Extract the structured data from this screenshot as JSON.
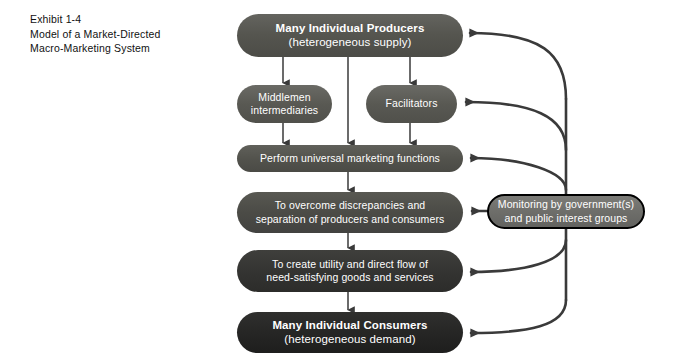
{
  "exhibit": {
    "number": "Exhibit 1-4",
    "title_line1": "Model of a Market-Directed",
    "title_line2": "Macro-Marketing System"
  },
  "diagram": {
    "type": "flow",
    "orientation": "top-to-bottom",
    "nodes": [
      {
        "id": "producers",
        "line1": "Many Individual Producers",
        "line2": "(heterogeneous supply)",
        "fill": "#55554f",
        "shape": "rounded-pill"
      },
      {
        "id": "middlemen",
        "line1": "Middlemen",
        "line2": "intermediaries",
        "fill": "#595953",
        "shape": "rounded-pill"
      },
      {
        "id": "facilitators",
        "line1": "Facilitators",
        "line2": "",
        "fill": "#595953",
        "shape": "rounded-pill"
      },
      {
        "id": "perform",
        "line1": "Perform universal marketing functions",
        "line2": "",
        "fill": "#53534d",
        "shape": "rounded-pill"
      },
      {
        "id": "overcome",
        "line1": "To overcome discrepancies and",
        "line2": "separation of producers and consumers",
        "fill": "#4b4b46",
        "shape": "rounded-pill"
      },
      {
        "id": "utility",
        "line1": "To create utility and direct flow of",
        "line2": "need-satisfying goods and services",
        "fill": "#343432",
        "shape": "rounded-pill"
      },
      {
        "id": "consumers",
        "line1": "Many Individual Consumers",
        "line2": "(heterogeneous demand)",
        "fill": "#262625",
        "shape": "rounded-pill"
      },
      {
        "id": "monitor",
        "line1": "Monitoring by government(s)",
        "line2": "and public interest groups",
        "fill": "#6e6e6a",
        "border": "#000000",
        "shape": "rounded-pill-outlined"
      }
    ],
    "edges": [
      {
        "from": "producers",
        "to": "middlemen",
        "style": "straight-arrow-down"
      },
      {
        "from": "producers",
        "to": "facilitators",
        "style": "straight-arrow-down"
      },
      {
        "from": "producers",
        "to": "perform",
        "style": "straight-arrow-down"
      },
      {
        "from": "middlemen",
        "to": "perform",
        "style": "straight-arrow-down"
      },
      {
        "from": "facilitators",
        "to": "perform",
        "style": "straight-arrow-down"
      },
      {
        "from": "perform",
        "to": "overcome",
        "style": "straight-arrow-down"
      },
      {
        "from": "overcome",
        "to": "utility",
        "style": "straight-arrow-down"
      },
      {
        "from": "utility",
        "to": "consumers",
        "style": "straight-arrow-down"
      },
      {
        "from": "monitor",
        "to": "producers",
        "style": "curved-arrow-left"
      },
      {
        "from": "monitor",
        "to": "facilitators",
        "style": "curved-arrow-left"
      },
      {
        "from": "monitor",
        "to": "perform",
        "style": "curved-arrow-left"
      },
      {
        "from": "monitor",
        "to": "overcome",
        "style": "straight-arrow-left"
      },
      {
        "from": "monitor",
        "to": "utility",
        "style": "curved-arrow-left"
      },
      {
        "from": "monitor",
        "to": "consumers",
        "style": "curved-arrow-left"
      }
    ],
    "edge_color": "#3a3a3a",
    "background": "#ffffff"
  }
}
